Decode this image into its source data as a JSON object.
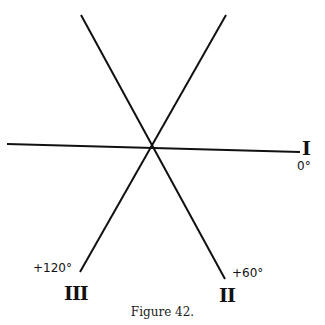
{
  "figure": {
    "caption": "Figure 42.",
    "axes": [
      {
        "id": "I",
        "roman": "I",
        "angle_label": "0°"
      },
      {
        "id": "II",
        "roman": "II",
        "angle_label": "+60°"
      },
      {
        "id": "III",
        "roman": "III",
        "angle_label": "+120°"
      }
    ],
    "line_color": "#111111",
    "background": "#ffffff"
  }
}
